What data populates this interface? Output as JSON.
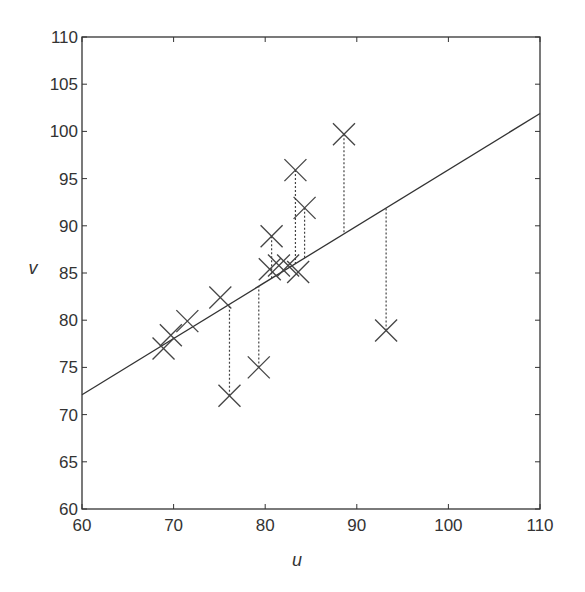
{
  "chart_data": {
    "type": "scatter",
    "title": "",
    "xlabel": "u",
    "ylabel": "v",
    "xlim": [
      60,
      110
    ],
    "ylim": [
      60,
      110
    ],
    "xticks": [
      60,
      70,
      80,
      90,
      100,
      110
    ],
    "yticks": [
      60,
      65,
      70,
      75,
      80,
      85,
      90,
      95,
      100,
      105,
      110
    ],
    "grid": false,
    "legend": null,
    "marker": "x",
    "series": [
      {
        "name": "observations",
        "points": [
          {
            "u": 68.9,
            "v": 77.0
          },
          {
            "u": 69.7,
            "v": 78.4
          },
          {
            "u": 71.5,
            "v": 79.9
          },
          {
            "u": 75.1,
            "v": 82.4
          },
          {
            "u": 76.1,
            "v": 72.0
          },
          {
            "u": 79.3,
            "v": 75.0
          },
          {
            "u": 80.7,
            "v": 88.9
          },
          {
            "u": 80.5,
            "v": 85.4
          },
          {
            "u": 81.5,
            "v": 85.8
          },
          {
            "u": 82.5,
            "v": 85.8
          },
          {
            "u": 83.3,
            "v": 95.9
          },
          {
            "u": 83.6,
            "v": 85.1
          },
          {
            "u": 84.3,
            "v": 91.9
          },
          {
            "u": 88.6,
            "v": 99.7
          },
          {
            "u": 93.2,
            "v": 78.9
          }
        ]
      }
    ],
    "fit_line": {
      "intercept_at_60": 72.1,
      "slope": 0.596,
      "u_range": [
        60,
        110
      ]
    },
    "residual_lines_for_u": [
      76.1,
      79.3,
      80.7,
      83.3,
      84.3,
      88.6,
      93.2
    ],
    "colors": {
      "axes": "#333333",
      "markers": "#444444",
      "line": "#333333",
      "residuals": "#444444"
    }
  }
}
